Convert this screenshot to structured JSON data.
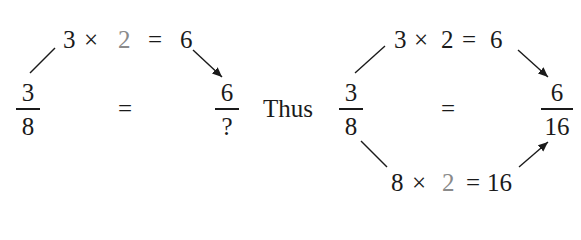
{
  "left": {
    "top_equation": {
      "a": "3",
      "op": "×",
      "factor": "2",
      "eq": "=",
      "result": "6"
    },
    "fraction_left": {
      "numerator": "3",
      "denominator": "8"
    },
    "equals": "=",
    "fraction_right": {
      "numerator": "6",
      "denominator": "?"
    }
  },
  "connector": "Thus",
  "right": {
    "top_equation": {
      "a": "3",
      "op": "×",
      "factor": "2",
      "eq": "=",
      "result": "6"
    },
    "fraction_left": {
      "numerator": "3",
      "denominator": "8"
    },
    "equals": "=",
    "fraction_right": {
      "numerator": "6",
      "denominator": "16"
    },
    "bottom_equation": {
      "a": "8",
      "op": "×",
      "factor": "2",
      "eq": "=",
      "result": "16"
    }
  },
  "colors": {
    "text": "#1a1a1a",
    "highlight_factor": "#8a8a8a"
  }
}
